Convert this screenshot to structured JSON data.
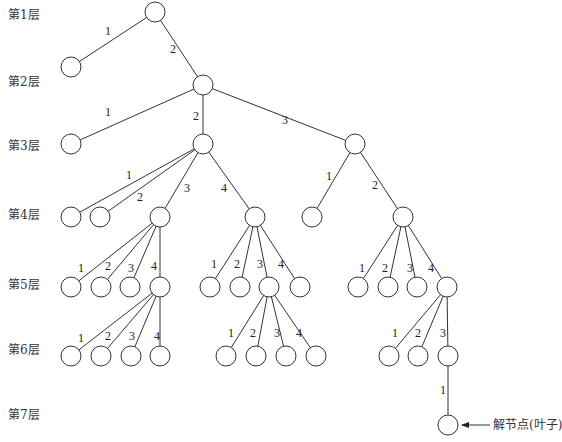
{
  "diagram": {
    "type": "search-tree",
    "node_radius": 10,
    "level_labels": [
      {
        "text": "第1层",
        "y": 19
      },
      {
        "text": "第2层",
        "y": 86
      },
      {
        "text": "第3层",
        "y": 150
      },
      {
        "text": "第4层",
        "y": 219
      },
      {
        "text": "第5层",
        "y": 289
      },
      {
        "text": "第6层",
        "y": 354
      },
      {
        "text": "第7层",
        "y": 419
      }
    ],
    "nodes": [
      {
        "id": "n1",
        "x": 155,
        "y": 12
      },
      {
        "id": "n2a",
        "x": 71,
        "y": 67
      },
      {
        "id": "n2b",
        "x": 203,
        "y": 85
      },
      {
        "id": "n3a",
        "x": 71,
        "y": 144
      },
      {
        "id": "n3b",
        "x": 203,
        "y": 144
      },
      {
        "id": "n3c",
        "x": 355,
        "y": 144
      },
      {
        "id": "n4a",
        "x": 71,
        "y": 217
      },
      {
        "id": "n4b",
        "x": 100,
        "y": 217
      },
      {
        "id": "n4c",
        "x": 160,
        "y": 217
      },
      {
        "id": "n4d",
        "x": 255,
        "y": 217
      },
      {
        "id": "n4e",
        "x": 312,
        "y": 217
      },
      {
        "id": "n4f",
        "x": 403,
        "y": 217
      },
      {
        "id": "n5a",
        "x": 71,
        "y": 287
      },
      {
        "id": "n5b",
        "x": 101,
        "y": 287
      },
      {
        "id": "n5c",
        "x": 130,
        "y": 287
      },
      {
        "id": "n5d",
        "x": 160,
        "y": 287
      },
      {
        "id": "n5e",
        "x": 210,
        "y": 287
      },
      {
        "id": "n5f",
        "x": 240,
        "y": 287
      },
      {
        "id": "n5g",
        "x": 269,
        "y": 287
      },
      {
        "id": "n5h",
        "x": 300,
        "y": 287
      },
      {
        "id": "n5i",
        "x": 358,
        "y": 287
      },
      {
        "id": "n5j",
        "x": 388,
        "y": 287
      },
      {
        "id": "n5k",
        "x": 417,
        "y": 287
      },
      {
        "id": "n5l",
        "x": 447,
        "y": 287
      },
      {
        "id": "n6a",
        "x": 71,
        "y": 356
      },
      {
        "id": "n6b",
        "x": 101,
        "y": 356
      },
      {
        "id": "n6c",
        "x": 131,
        "y": 356
      },
      {
        "id": "n6d",
        "x": 160,
        "y": 356
      },
      {
        "id": "n6e",
        "x": 226,
        "y": 356
      },
      {
        "id": "n6f",
        "x": 256,
        "y": 356
      },
      {
        "id": "n6g",
        "x": 286,
        "y": 356
      },
      {
        "id": "n6h",
        "x": 316,
        "y": 356
      },
      {
        "id": "n6i",
        "x": 389,
        "y": 356
      },
      {
        "id": "n6j",
        "x": 418,
        "y": 356
      },
      {
        "id": "n6k",
        "x": 448,
        "y": 356
      },
      {
        "id": "n7a",
        "x": 448,
        "y": 425
      }
    ],
    "edges": [
      {
        "from": "n1",
        "to": "n2a",
        "label": "1",
        "lx": 105,
        "ly": 35
      },
      {
        "from": "n1",
        "to": "n2b",
        "label": "2",
        "lx": 170,
        "ly": 53
      },
      {
        "from": "n2b",
        "to": "n3a",
        "label": "1",
        "lx": 105,
        "ly": 116
      },
      {
        "from": "n2b",
        "to": "n3b",
        "label": "2",
        "lx": 193,
        "ly": 120
      },
      {
        "from": "n2b",
        "to": "n3c",
        "label": "3",
        "lx": 282,
        "ly": 124
      },
      {
        "from": "n3b",
        "to": "n4a",
        "label": "1",
        "lx": 126,
        "ly": 179
      },
      {
        "from": "n3b",
        "to": "n4b",
        "label": "2",
        "lx": 137,
        "ly": 201
      },
      {
        "from": "n3b",
        "to": "n4c",
        "label": "3",
        "lx": 184,
        "ly": 192
      },
      {
        "from": "n3b",
        "to": "n4d",
        "label": "4",
        "lx": 221,
        "ly": 192
      },
      {
        "from": "n3c",
        "to": "n4e",
        "label": "1",
        "lx": 326,
        "ly": 180
      },
      {
        "from": "n3c",
        "to": "n4f",
        "label": "2",
        "lx": 372,
        "ly": 189
      },
      {
        "from": "n4c",
        "to": "n5a",
        "label": "1",
        "lx": 78,
        "ly": 272
      },
      {
        "from": "n4c",
        "to": "n5b",
        "label": "2",
        "lx": 105,
        "ly": 270
      },
      {
        "from": "n4c",
        "to": "n5c",
        "label": "3",
        "lx": 128,
        "ly": 272
      },
      {
        "from": "n4c",
        "to": "n5d",
        "label": "4",
        "lx": 151,
        "ly": 270
      },
      {
        "from": "n4d",
        "to": "n5e",
        "label": "1",
        "lx": 211,
        "ly": 268
      },
      {
        "from": "n4d",
        "to": "n5f",
        "label": "2",
        "lx": 234,
        "ly": 268
      },
      {
        "from": "n4d",
        "to": "n5g",
        "label": "3",
        "lx": 257,
        "ly": 268
      },
      {
        "from": "n4d",
        "to": "n5h",
        "label": "4",
        "lx": 278,
        "ly": 268
      },
      {
        "from": "n4f",
        "to": "n5i",
        "label": "1",
        "lx": 359,
        "ly": 272
      },
      {
        "from": "n4f",
        "to": "n5j",
        "label": "2",
        "lx": 382,
        "ly": 272
      },
      {
        "from": "n4f",
        "to": "n5k",
        "label": "3",
        "lx": 407,
        "ly": 272
      },
      {
        "from": "n4f",
        "to": "n5l",
        "label": "4",
        "lx": 428,
        "ly": 272
      },
      {
        "from": "n5d",
        "to": "n6a",
        "label": "1",
        "lx": 78,
        "ly": 342
      },
      {
        "from": "n5d",
        "to": "n6b",
        "label": "2",
        "lx": 105,
        "ly": 340
      },
      {
        "from": "n5d",
        "to": "n6c",
        "label": "3",
        "lx": 129,
        "ly": 340
      },
      {
        "from": "n5d",
        "to": "n6d",
        "label": "4",
        "lx": 154,
        "ly": 340
      },
      {
        "from": "n5g",
        "to": "n6e",
        "label": "1",
        "lx": 228,
        "ly": 337
      },
      {
        "from": "n5g",
        "to": "n6f",
        "label": "2",
        "lx": 250,
        "ly": 337
      },
      {
        "from": "n5g",
        "to": "n6g",
        "label": "3",
        "lx": 274,
        "ly": 337
      },
      {
        "from": "n5g",
        "to": "n6h",
        "label": "4",
        "lx": 296,
        "ly": 337
      },
      {
        "from": "n5l",
        "to": "n6i",
        "label": "1",
        "lx": 392,
        "ly": 337
      },
      {
        "from": "n5l",
        "to": "n6j",
        "label": "2",
        "lx": 415,
        "ly": 337
      },
      {
        "from": "n5l",
        "to": "n6k",
        "label": "3",
        "lx": 440,
        "ly": 337
      },
      {
        "from": "n6k",
        "to": "n7a",
        "label": "1",
        "lx": 440,
        "ly": 394
      }
    ],
    "annotation": {
      "text": "解节点(叶子)",
      "target": "n7a",
      "arrow_from_x": 490,
      "arrow_to_x": 462,
      "y": 425,
      "text_x": 493
    }
  }
}
